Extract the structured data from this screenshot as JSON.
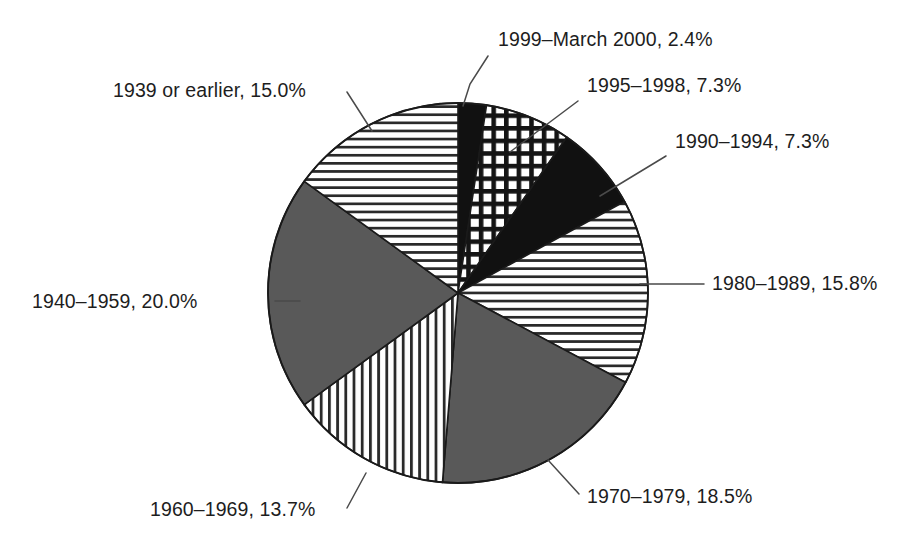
{
  "chart_data": {
    "type": "pie",
    "title": "",
    "subtitle": "",
    "xlabel": "",
    "ylabel": "",
    "legend_position": "none",
    "grid": false,
    "units": "percent",
    "total": 100.0,
    "start_angle_deg": 0,
    "direction": "clockwise",
    "categories": [
      "1999–March 2000",
      "1995–1998",
      "1990–1994",
      "1980–1989",
      "1970–1979",
      "1960–1969",
      "1940–1959",
      "1939 or earlier"
    ],
    "values": [
      2.4,
      7.3,
      7.3,
      15.8,
      18.5,
      13.7,
      20.0,
      15.0
    ],
    "slices": [
      {
        "label": "1999–March 2000, 2.4%",
        "category": "1999–March 2000",
        "value": 2.4,
        "fill": "solid-black",
        "color": "#111111",
        "label_x": 498,
        "label_y": 46,
        "label_anchor": "start",
        "leader": "M 488 56 L 470 84 L 463 106"
      },
      {
        "label": "1995–1998, 7.3%",
        "category": "1995–1998",
        "value": 7.3,
        "fill": "crosshatch",
        "color": "#111111",
        "label_x": 587,
        "label_y": 92,
        "label_anchor": "start",
        "leader": "M 578 101 L 510 152"
      },
      {
        "label": "1990–1994, 7.3%",
        "category": "1990–1994",
        "value": 7.3,
        "fill": "solid-black",
        "color": "#111111",
        "label_x": 675,
        "label_y": 148,
        "label_anchor": "start",
        "leader": "M 666 156 L 600 196"
      },
      {
        "label": "1980–1989, 15.8%",
        "category": "1980–1989",
        "value": 15.8,
        "fill": "horizontal-stripes",
        "color": "#111111",
        "label_x": 712,
        "label_y": 290,
        "label_anchor": "start",
        "leader": "M 704 284 L 640 284"
      },
      {
        "label": "1970–1979, 18.5%",
        "category": "1970–1979",
        "value": 18.5,
        "fill": "solid-gray",
        "color": "#595959",
        "label_x": 587,
        "label_y": 503,
        "label_anchor": "start",
        "leader": "M 579 494 L 548 460"
      },
      {
        "label": "1960–1969, 13.7%",
        "category": "1960–1969",
        "value": 13.7,
        "fill": "vertical-stripes",
        "color": "#111111",
        "label_x": 150,
        "label_y": 516,
        "label_anchor": "start",
        "leader": "M 347 508 L 366 473"
      },
      {
        "label": "1940–1959, 20.0%",
        "category": "1940–1959",
        "value": 20.0,
        "fill": "solid-gray",
        "color": "#595959",
        "label_x": 32,
        "label_y": 308,
        "label_anchor": "start",
        "leader": "M 275 301 L 300 301"
      },
      {
        "label": "1939 or earlier, 15.0%",
        "category": "1939 or earlier",
        "value": 15.0,
        "fill": "horizontal-stripes",
        "color": "#111111",
        "label_x": 113,
        "label_y": 97,
        "label_anchor": "start",
        "leader": "M 347 92 L 372 131"
      }
    ]
  }
}
